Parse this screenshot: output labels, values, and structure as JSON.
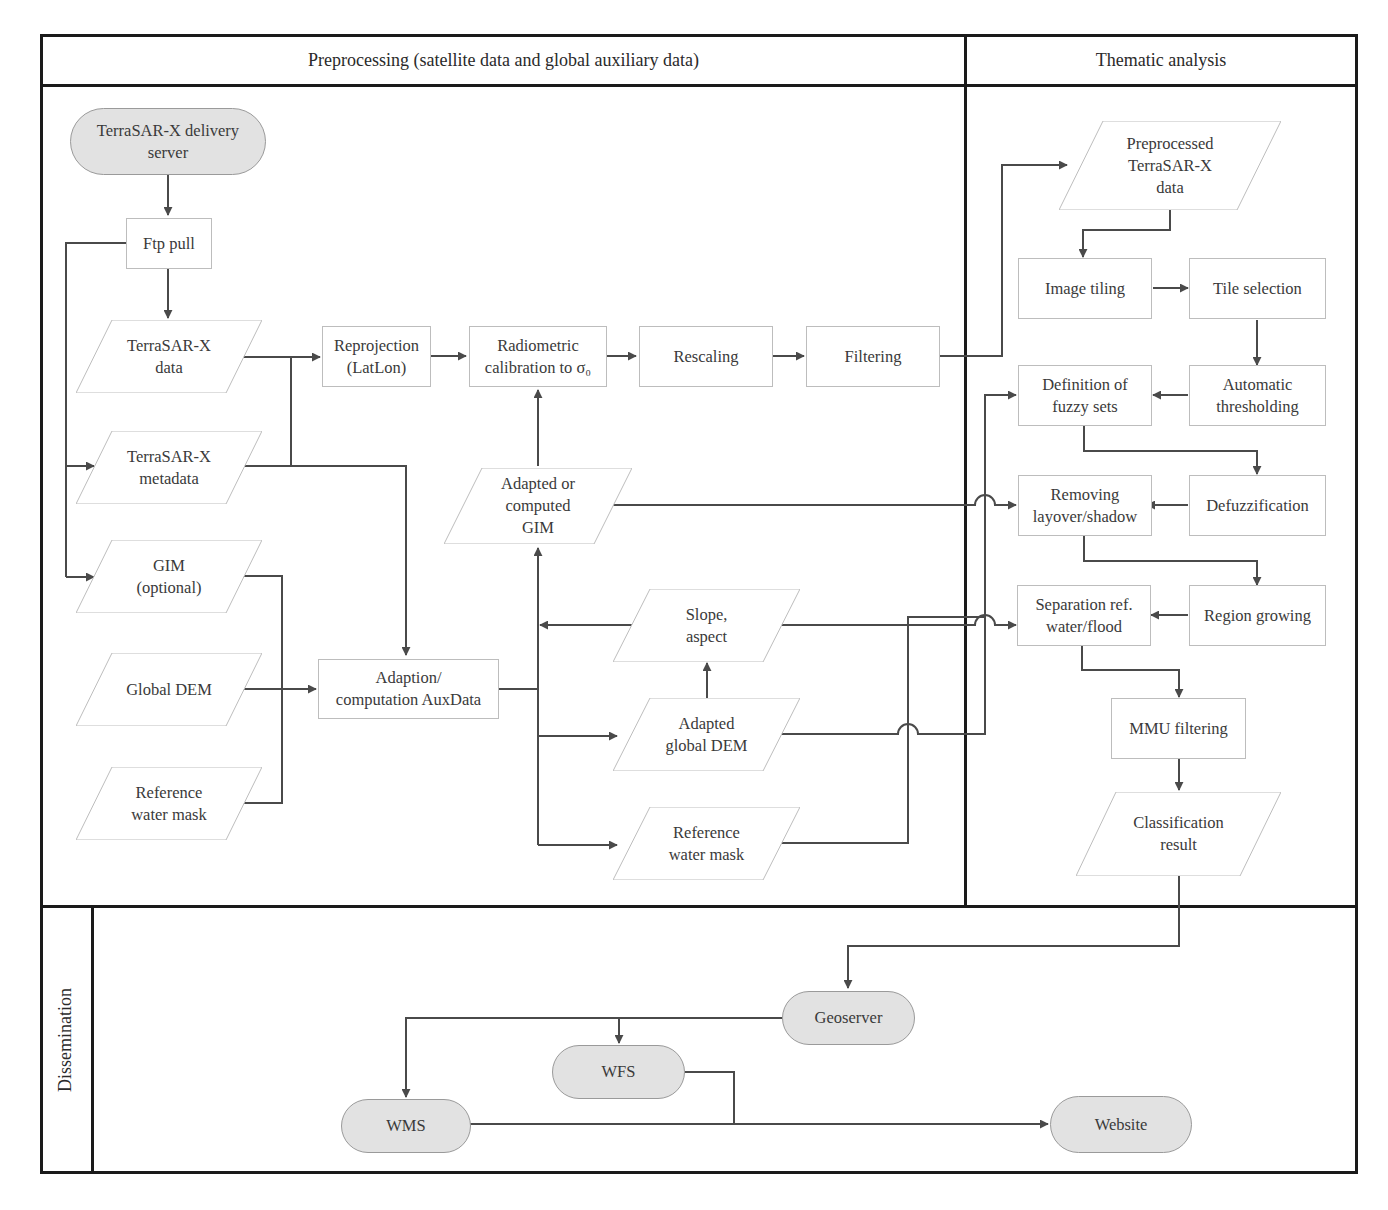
{
  "lanes": {
    "preprocessing": "Preprocessing (satellite data and global auxiliary data)",
    "thematic": "Thematic analysis",
    "dissemination": "Dissemination"
  },
  "nodes": {
    "delivery_server": "TerraSAR-X delivery\nserver",
    "ftp_pull": "Ftp pull",
    "tsx_data": "TerraSAR-X\ndata",
    "tsx_metadata": "TerraSAR-X\nmetadata",
    "gim_optional": "GIM\n(optional)",
    "global_dem": "Global DEM",
    "ref_water_mask_in": "Reference\nwater mask",
    "reprojection": "Reprojection\n(LatLon)",
    "radiometric": "Radiometric\ncalibration to σ₀",
    "rescaling": "Rescaling",
    "filtering": "Filtering",
    "adapted_gim": "Adapted or\ncomputed\nGIM",
    "adaption_aux": "Adaption/\ncomputation AuxData",
    "slope_aspect": "Slope,\naspect",
    "adapted_dem": "Adapted\nglobal DEM",
    "ref_water_mask_out": "Reference\nwater mask",
    "preprocessed_tsx": "Preprocessed\nTerraSAR-X\ndata",
    "image_tiling": "Image tiling",
    "tile_selection": "Tile selection",
    "fuzzy_sets": "Definition of\nfuzzy sets",
    "auto_threshold": "Automatic\nthresholding",
    "removing_layover": "Removing\nlayover/shadow",
    "defuzzification": "Defuzzification",
    "separation": "Separation ref.\nwater/flood",
    "region_growing": "Region growing",
    "mmu_filtering": "MMU filtering",
    "classification_result": "Classification\nresult",
    "geoserver": "Geoserver",
    "wfs": "WFS",
    "wms": "WMS",
    "website": "Website"
  },
  "colors": {
    "frame": "#1a1a1a",
    "connector": "#4a4a4a",
    "terminal_fill": "#e2e2e2",
    "box_border": "#bdbdbd"
  }
}
